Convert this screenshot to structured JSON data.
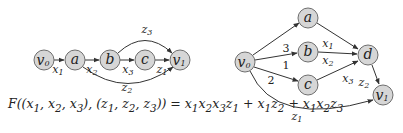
{
  "left_graph": {
    "nodes": [
      {
        "id": "v0",
        "label": "v",
        "sub": "0",
        "x": 44,
        "y": 60
      },
      {
        "id": "a",
        "label": "a",
        "sub": "",
        "x": 75,
        "y": 60
      },
      {
        "id": "b",
        "label": "b",
        "sub": "",
        "x": 110,
        "y": 60
      },
      {
        "id": "c",
        "label": "c",
        "sub": "",
        "x": 145,
        "y": 60
      },
      {
        "id": "v1",
        "label": "v",
        "sub": "1",
        "x": 180,
        "y": 60
      }
    ],
    "edges": [
      {
        "from": "v0",
        "to": "a",
        "label": "x",
        "sub": "1"
      },
      {
        "from": "a",
        "to": "b",
        "label": "x",
        "sub": "2"
      },
      {
        "from": "b",
        "to": "c",
        "label": "x",
        "sub": "3"
      },
      {
        "from": "c",
        "to": "v1",
        "label": "z",
        "sub": "1"
      },
      {
        "from": "b",
        "to": "v1",
        "label": "z",
        "sub": "3"
      },
      {
        "from": "a",
        "to": "v1",
        "label": "z",
        "sub": "2"
      }
    ]
  },
  "right_graph": {
    "nodes": [
      {
        "id": "v0",
        "label": "v",
        "sub": "0",
        "x": 245,
        "y": 62
      },
      {
        "id": "a",
        "label": "a",
        "sub": "",
        "x": 308,
        "y": 18
      },
      {
        "id": "b",
        "label": "b",
        "sub": "",
        "x": 308,
        "y": 52
      },
      {
        "id": "c",
        "label": "c",
        "sub": "",
        "x": 308,
        "y": 85
      },
      {
        "id": "d",
        "label": "d",
        "sub": "",
        "x": 368,
        "y": 55
      },
      {
        "id": "v1",
        "label": "v",
        "sub": "1",
        "x": 383,
        "y": 95
      }
    ],
    "edges": [
      {
        "from": "v0",
        "to": "a",
        "label": ""
      },
      {
        "from": "v0",
        "to": "b",
        "label": "3"
      },
      {
        "from": "v0",
        "to": "c",
        "label": "1"
      },
      {
        "from": "v0",
        "to": "c",
        "label": "2",
        "note": "second weight label"
      },
      {
        "from": "v0",
        "to": "v1",
        "label": "z",
        "sub": "1"
      },
      {
        "from": "a",
        "to": "d",
        "label": ""
      },
      {
        "from": "b",
        "to": "d",
        "label_above": "x1",
        "label_below": "x2"
      },
      {
        "from": "c",
        "to": "d",
        "label": "x",
        "sub": "3"
      },
      {
        "from": "d",
        "to": "v1",
        "label": "z",
        "sub": "2"
      }
    ]
  },
  "formula": {
    "text": "F((x1, x2, x3), (z1, z2, z3)) = x1x2x3z1 + x1z2 + x1x2z3"
  }
}
